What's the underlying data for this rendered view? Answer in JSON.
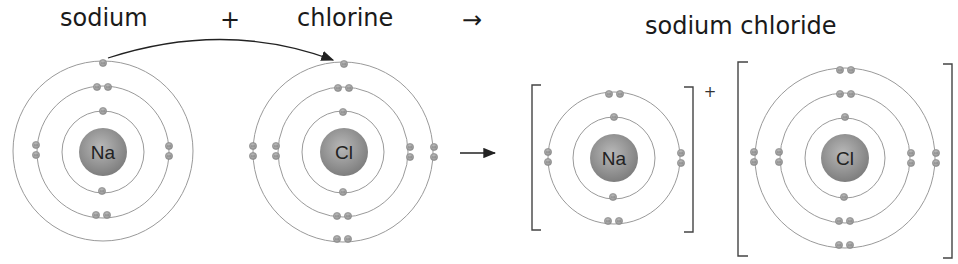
{
  "equation": {
    "reactant1": "sodium",
    "plus": "+",
    "reactant2": "chlorine",
    "arrow": "→",
    "product": "sodium chloride"
  },
  "atoms": {
    "sodium": {
      "symbol": "Na",
      "shells": [
        2,
        8,
        1
      ]
    },
    "chlorine": {
      "symbol": "Cl",
      "shells": [
        2,
        8,
        7
      ]
    }
  },
  "ions": {
    "sodium_ion": {
      "symbol": "Na",
      "charge": "+",
      "shells": [
        2,
        8
      ]
    },
    "chloride_ion": {
      "symbol": "Cl",
      "charge": "",
      "shells": [
        2,
        8,
        8
      ]
    }
  },
  "colors": {
    "nucleus": "#8a8a8a",
    "ring": "#9a9a9a",
    "electron": "#a0a0a0",
    "text": "#1a1a1a"
  }
}
